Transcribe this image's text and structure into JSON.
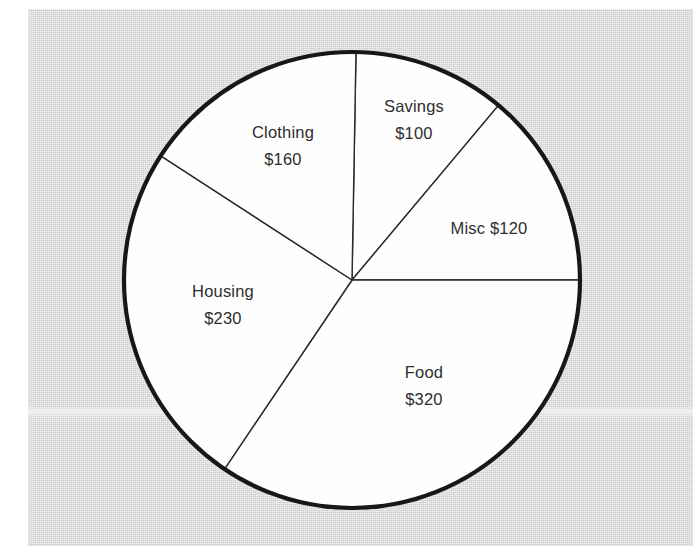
{
  "chart_data": {
    "type": "pie",
    "title": "",
    "subtitle": "",
    "xlabel": "",
    "ylabel": "",
    "legend_position": "none",
    "grid": false,
    "value_prefix": "$",
    "total": 930,
    "categories": [
      "Savings",
      "Misc",
      "Food",
      "Housing",
      "Clothing"
    ],
    "values": [
      100,
      120,
      320,
      230,
      160
    ],
    "slices": [
      {
        "name": "Savings",
        "label": "Savings",
        "value": 100,
        "value_text": "$100",
        "label_lines": [
          "Savings",
          "$100"
        ],
        "single_line": false,
        "start_angle_deg": -89,
        "end_angle_deg": -50,
        "label_x": 414,
        "label_y": 112,
        "label_line2_y": 139
      },
      {
        "name": "Misc",
        "label": "Misc",
        "value": 120,
        "value_text": "$120",
        "label_lines": [
          "Misc  $120"
        ],
        "single_line": true,
        "start_angle_deg": -50,
        "end_angle_deg": 0,
        "label_x": 489,
        "label_y": 234,
        "label_line2_y": 234
      },
      {
        "name": "Food",
        "label": "Food",
        "value": 320,
        "value_text": "$320",
        "label_lines": [
          "Food",
          "$320"
        ],
        "single_line": false,
        "start_angle_deg": 0,
        "end_angle_deg": 124,
        "label_x": 424,
        "label_y": 378,
        "label_line2_y": 405
      },
      {
        "name": "Housing",
        "label": "Housing",
        "value": 230,
        "value_text": "$230",
        "label_lines": [
          "Housing",
          "$230"
        ],
        "single_line": false,
        "start_angle_deg": 124,
        "end_angle_deg": 213,
        "label_x": 223,
        "label_y": 297,
        "label_line2_y": 324
      },
      {
        "name": "Clothing",
        "label": "Clothing",
        "value": 160,
        "value_text": "$160",
        "label_lines": [
          "Clothing",
          "$160"
        ],
        "single_line": false,
        "start_angle_deg": 213,
        "end_angle_deg": 271,
        "label_x": 283,
        "label_y": 138,
        "label_line2_y": 165
      }
    ],
    "geometry": {
      "center_x": 352,
      "center_y": 280,
      "radius": 228
    },
    "colors": {
      "slice_fill": "#fefefe",
      "slice_divider": "#2a2a2a",
      "outline": "#171717",
      "text": "#2e2e2e",
      "background": "#d9d9d9",
      "page": "#ffffff"
    }
  }
}
